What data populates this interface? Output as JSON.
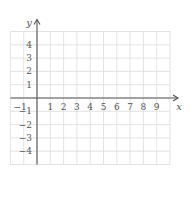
{
  "chart_data": {
    "type": "scatter",
    "title": "",
    "xlabel": "x",
    "ylabel": "y",
    "xlim": [
      -2,
      10
    ],
    "ylim": [
      -5,
      5
    ],
    "grid": true,
    "x_ticks": [
      -1,
      1,
      2,
      3,
      4,
      5,
      6,
      7,
      8,
      9
    ],
    "y_ticks": [
      -4,
      -3,
      -2,
      -1,
      1,
      2,
      3,
      4
    ],
    "x_tick_labels": [
      "−1",
      "1",
      "2",
      "3",
      "4",
      "5",
      "6",
      "7",
      "8",
      "9"
    ],
    "y_tick_labels": [
      "−4",
      "−3",
      "−2",
      "−1",
      "1",
      "2",
      "3",
      "4"
    ],
    "series": [],
    "colors": {
      "grid": "#dcdcdc",
      "axis": "#555555"
    }
  }
}
